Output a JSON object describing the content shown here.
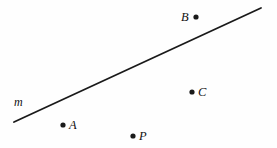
{
  "figure": {
    "type": "geometry-diagram",
    "width": 277,
    "height": 148,
    "background_color": "#fefefe",
    "ink_color": "#1a1a1a",
    "line": {
      "name": "m",
      "label": "m",
      "label_x": 14,
      "label_y": 96,
      "x1": 14,
      "y1": 122,
      "x2": 261,
      "y2": 8,
      "stroke_width": 1.8,
      "stroke_color": "#1a1a1a"
    },
    "points": [
      {
        "label": "B",
        "dot_x": 196,
        "dot_y": 17,
        "dot_radius": 2.6,
        "label_x": 181,
        "label_y": 11,
        "label_side": "left",
        "position_relative_to_line": "above"
      },
      {
        "label": "C",
        "dot_x": 192,
        "dot_y": 92,
        "dot_radius": 2.6,
        "label_x": 198,
        "label_y": 86,
        "label_side": "right",
        "position_relative_to_line": "below"
      },
      {
        "label": "A",
        "dot_x": 63,
        "dot_y": 125,
        "dot_radius": 2.6,
        "label_x": 69,
        "label_y": 119,
        "label_side": "right",
        "position_relative_to_line": "below"
      },
      {
        "label": "P",
        "dot_x": 133,
        "dot_y": 136,
        "dot_radius": 2.6,
        "label_x": 139,
        "label_y": 130,
        "label_side": "right",
        "position_relative_to_line": "below"
      }
    ]
  }
}
